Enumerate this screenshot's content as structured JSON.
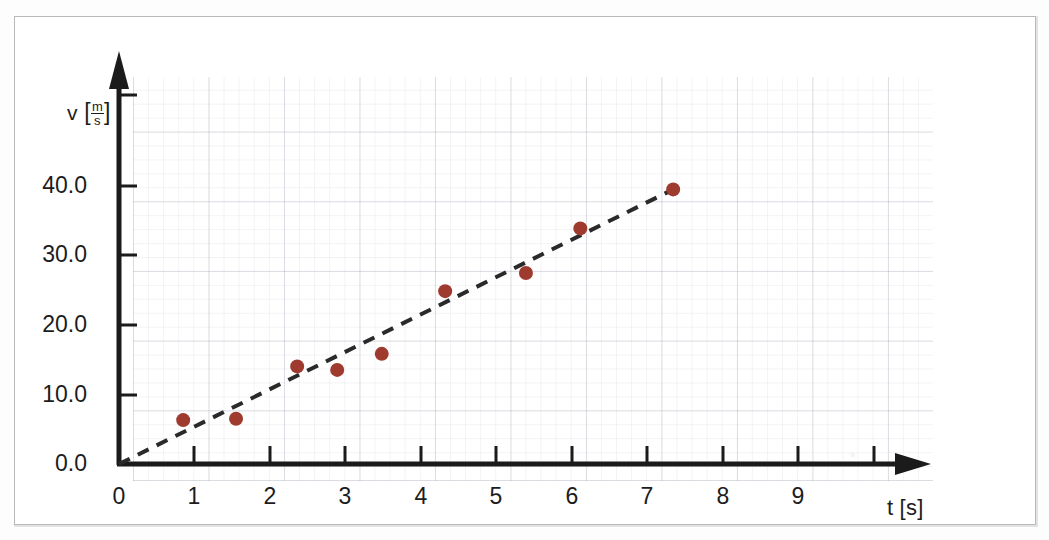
{
  "chart_data": {
    "type": "scatter",
    "title": "",
    "xlabel": "t [s]",
    "ylabel": "v [m/s]",
    "ylabel_symbol": "v",
    "ylabel_unit_numerator": "m",
    "ylabel_unit_denominator": "s",
    "xlabel_symbol": "t",
    "xlabel_unit": "s",
    "xlim": [
      0,
      9.8
    ],
    "ylim": [
      0,
      50.5
    ],
    "xticks": [
      0,
      1,
      2,
      3,
      4,
      5,
      6,
      7,
      8,
      9
    ],
    "xtick_labels": [
      "0",
      "1",
      "2",
      "3",
      "4",
      "5",
      "6",
      "7",
      "8",
      "9"
    ],
    "yticks": [
      0.0,
      10.0,
      20.0,
      30.0,
      40.0
    ],
    "ytick_labels": [
      "0.0",
      "10.0",
      "20.0",
      "30.0",
      "40.0"
    ],
    "grid": true,
    "grid_style": "graph-paper, faint minor and major lines",
    "legend": "none",
    "axis_style": "arrow-tipped black axes",
    "point_color": "#9e3a2e",
    "point_radius_px": 7,
    "series": [
      {
        "name": "measured velocity",
        "marker": "filled-circle",
        "x": [
          0.85,
          1.55,
          2.36,
          2.89,
          3.48,
          4.32,
          5.39,
          6.11,
          7.34
        ],
        "y": [
          6.3,
          6.5,
          14.0,
          13.5,
          15.8,
          24.8,
          27.4,
          33.8,
          39.4
        ]
      }
    ],
    "trendline": {
      "name": "fitted line",
      "style": "dashed",
      "color": "#2a2a2a",
      "x": [
        0.0,
        7.34
      ],
      "y": [
        0.0,
        39.4
      ],
      "slope": 5.37,
      "intercept": 0.0
    },
    "annotations": []
  },
  "figure": {
    "border_color": "#b9b9bb",
    "background": "#ffffff",
    "smudge_mark": "·s·"
  }
}
